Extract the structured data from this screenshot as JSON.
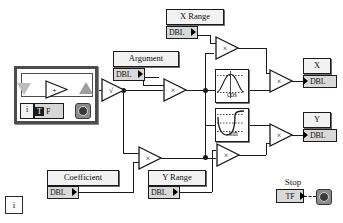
{
  "diagram": {
    "figure_marker": "i"
  },
  "controls": [
    {
      "name": "x-range",
      "label": "X Range",
      "terminal": "DBL"
    },
    {
      "name": "argument",
      "label": "Argument",
      "terminal": "DBL"
    },
    {
      "name": "coefficient",
      "label": "Coefficient",
      "terminal": "DBL"
    },
    {
      "name": "y-range",
      "label": "Y Range",
      "terminal": "DBL"
    }
  ],
  "indicators": [
    {
      "name": "x-output",
      "label": "X",
      "terminal": "DBL"
    },
    {
      "name": "y-output",
      "label": "Y",
      "terminal": "DBL"
    }
  ],
  "stop": {
    "label": "Stop",
    "terminal_true": "T",
    "terminal_false": "F",
    "terminal": "TF",
    "icon": "stop-button-icon"
  },
  "loop": {
    "iteration_terminal": "i",
    "conditional_terminal_true": "T",
    "conditional_terminal_false": "F",
    "conditional_icon": "stop-condition-icon",
    "add_operator": "+"
  },
  "nodes": [
    {
      "name": "sqrt-node",
      "glyph": "√"
    },
    {
      "name": "multiply-arg",
      "glyph": "×"
    },
    {
      "name": "multiply-xrange",
      "glyph": "×"
    },
    {
      "name": "multiply-x-out",
      "glyph": "×"
    },
    {
      "name": "multiply-coeff",
      "glyph": "×"
    },
    {
      "name": "multiply-yrange",
      "glyph": "×"
    },
    {
      "name": "multiply-y-out",
      "glyph": "×"
    }
  ],
  "functions": [
    {
      "name": "cosine-function",
      "label": "cos"
    },
    {
      "name": "sine-function",
      "label": "sin"
    }
  ],
  "colors": {
    "wire": "#1a1a1a",
    "terminal_fill": "#d9d9d9",
    "label_fill": "#f2f2f2",
    "structure_border": "#4d4d4d",
    "background": "#ffffff"
  }
}
